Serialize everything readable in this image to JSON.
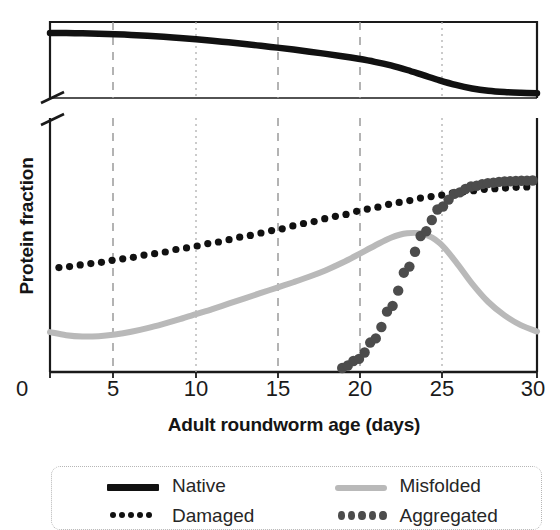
{
  "chart_data": {
    "type": "line",
    "title": "",
    "xlabel": "Adult roundworm age (days)",
    "ylabel": "Protein fraction",
    "xlim": [
      0,
      30
    ],
    "xticks": [
      0,
      5,
      10,
      15,
      20,
      25,
      30
    ],
    "xtick_labels": [
      "0",
      "5",
      "10",
      "15",
      "20",
      "25",
      "30"
    ],
    "yticks": [],
    "ytick_labels": [],
    "ylim": [
      0,
      1
    ],
    "broken_y_axis": true,
    "grid": "vertical dashed gridlines at 5, 10, 15, 20, 25",
    "legend_position": "below-plot",
    "x": [
      0,
      1,
      2,
      3,
      4,
      5,
      6,
      7,
      8,
      9,
      10,
      11,
      12,
      13,
      14,
      15,
      16,
      17,
      18,
      19,
      20,
      21,
      22,
      23,
      24,
      25,
      26,
      27,
      28,
      29,
      30
    ],
    "series": [
      {
        "name": "Native",
        "style": "solid-thick-black",
        "color": "#111111",
        "panel": "upper",
        "values": [
          0.985,
          0.984,
          0.982,
          0.979,
          0.975,
          0.97,
          0.963,
          0.955,
          0.946,
          0.936,
          0.925,
          0.913,
          0.9,
          0.886,
          0.872,
          0.857,
          0.841,
          0.824,
          0.806,
          0.786,
          0.763,
          0.735,
          0.7,
          0.66,
          0.62,
          0.585,
          0.558,
          0.54,
          0.53,
          0.525,
          0.522
        ]
      },
      {
        "name": "Damaged",
        "style": "dotted-small-black",
        "color": "#111111",
        "panel": "lower",
        "values": [
          0.3,
          0.305,
          0.311,
          0.318,
          0.325,
          0.333,
          0.341,
          0.349,
          0.358,
          0.367,
          0.376,
          0.386,
          0.396,
          0.406,
          0.416,
          0.427,
          0.438,
          0.449,
          0.46,
          0.471,
          0.482,
          0.492,
          0.502,
          0.511,
          0.519,
          0.526,
          0.532,
          0.537,
          0.54,
          0.543,
          0.545
        ]
      },
      {
        "name": "Misfolded",
        "style": "solid-light-gray",
        "color": "#b9b9b9",
        "panel": "lower",
        "values": [
          0.11,
          0.101,
          0.097,
          0.098,
          0.103,
          0.111,
          0.122,
          0.135,
          0.149,
          0.164,
          0.179,
          0.195,
          0.211,
          0.227,
          0.243,
          0.259,
          0.276,
          0.295,
          0.317,
          0.342,
          0.368,
          0.392,
          0.405,
          0.403,
          0.376,
          0.32,
          0.255,
          0.2,
          0.16,
          0.131,
          0.112
        ]
      },
      {
        "name": "Aggregated",
        "style": "dotted-large-gray",
        "color": "#4c4c4c",
        "panel": "lower",
        "values": [
          0.0,
          0.0,
          0.0,
          0.0,
          0.0,
          0.0,
          0.0,
          0.0,
          0.0,
          0.0,
          0.0,
          0.0,
          0.0,
          0.0,
          0.0,
          0.0,
          0.0,
          0.0,
          0.003,
          0.03,
          0.09,
          0.185,
          0.3,
          0.405,
          0.48,
          0.524,
          0.545,
          0.555,
          0.56,
          0.562,
          0.563
        ]
      }
    ]
  },
  "axes": {
    "y_title": "Protein fraction",
    "x_title": "Adult roundworm age (days)",
    "tick_labels": [
      "0",
      "5",
      "10",
      "15",
      "20",
      "25",
      "30"
    ]
  },
  "legend": {
    "items": [
      {
        "label": "Native",
        "swatch": "solid-thick-black"
      },
      {
        "label": "Misfolded",
        "swatch": "solid-light-gray"
      },
      {
        "label": "Damaged",
        "swatch": "dotted-small-black"
      },
      {
        "label": "Aggregated",
        "swatch": "dotted-large-gray"
      }
    ]
  },
  "colors": {
    "native": "#111111",
    "damaged": "#111111",
    "misfolded": "#b9b9b9",
    "aggregated": "#4c4c4c",
    "axis": "#1a1a1a",
    "grid": "#9a9a9a",
    "legend_border": "#b6b6b6"
  }
}
